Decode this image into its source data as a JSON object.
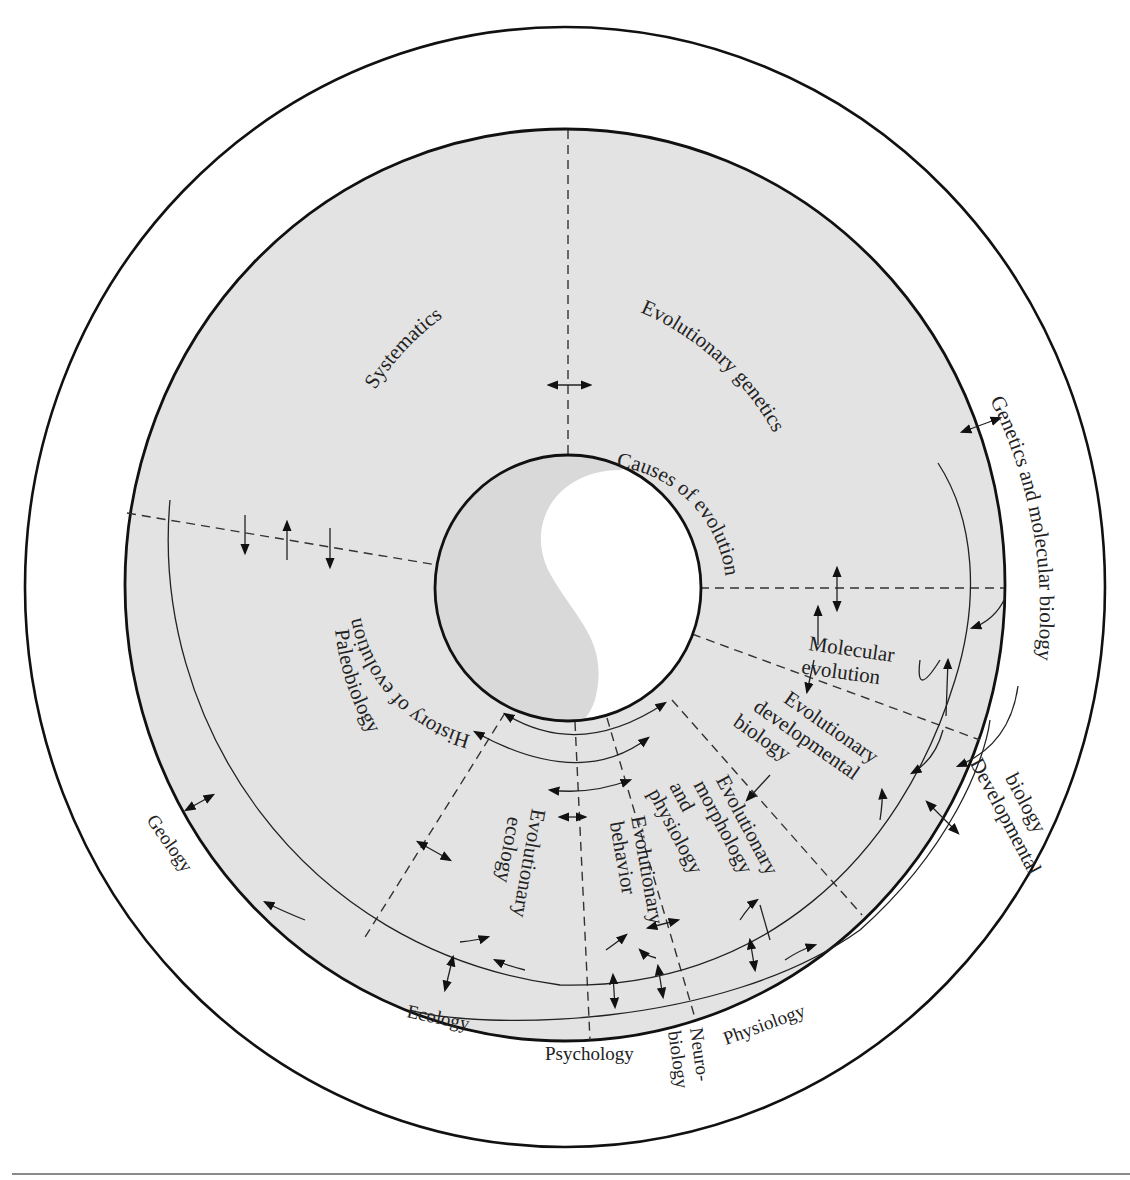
{
  "figure": {
    "fill_colors": {
      "disk": "#e3e3e3",
      "history_half": "#d9d9d9",
      "causes_half": "#ffffff",
      "line": "#111111"
    },
    "core": {
      "history_label": "History of evolution",
      "causes_label": "Causes of evolution"
    },
    "subfields": [
      {
        "id": "systematics",
        "label": "Systematics"
      },
      {
        "id": "evolutionary-genetics",
        "label": "Evolutionary genetics"
      },
      {
        "id": "molecular-evolution",
        "lines": [
          "Molecular",
          "evolution"
        ]
      },
      {
        "id": "evo-devo",
        "lines": [
          "Evolutionary",
          "developmental",
          "biology"
        ]
      },
      {
        "id": "evo-morph-phys",
        "lines": [
          "Evolutionary",
          "morphology",
          "and",
          "physiology"
        ]
      },
      {
        "id": "evo-behavior",
        "lines": [
          "Evolutionary",
          "behavior"
        ]
      },
      {
        "id": "evo-ecology",
        "lines": [
          "Evolutionary",
          "ecology"
        ]
      },
      {
        "id": "paleobiology",
        "label": "Paleobiology"
      }
    ],
    "outer_disciplines": [
      {
        "id": "genetics-molecular",
        "label": "Genetics and molecular biology"
      },
      {
        "id": "developmental",
        "lines": [
          "Developmental",
          "biology"
        ]
      },
      {
        "id": "physiology",
        "label": "Physiology"
      },
      {
        "id": "neurobiology",
        "lines": [
          "Neuro-",
          "biology"
        ]
      },
      {
        "id": "psychology",
        "label": "Psychology"
      },
      {
        "id": "ecology",
        "label": "Ecology"
      },
      {
        "id": "geology",
        "label": "Geology"
      }
    ]
  }
}
